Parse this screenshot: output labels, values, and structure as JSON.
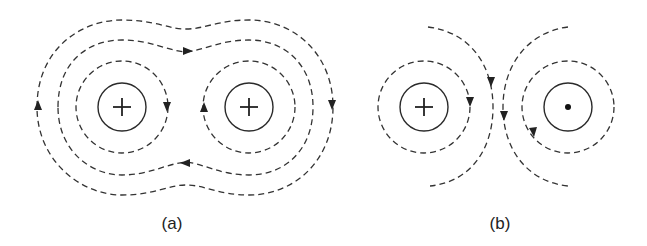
{
  "figure": {
    "panels": [
      {
        "id": "a",
        "caption": "(a)",
        "description": "Magnetic field lines around two parallel currents in the same direction",
        "conductors": [
          {
            "symbol": "+",
            "meaning": "current into page",
            "center": [
              122,
              107
            ]
          },
          {
            "symbol": "+",
            "meaning": "current into page",
            "center": [
              249,
              107
            ]
          }
        ]
      },
      {
        "id": "b",
        "caption": "(b)",
        "description": "Magnetic field lines around two antiparallel currents",
        "conductors": [
          {
            "symbol": "+",
            "meaning": "current into page",
            "center": [
              424,
              107
            ]
          },
          {
            "symbol": "•",
            "meaning": "current out of page",
            "center": [
              568,
              107
            ]
          }
        ]
      }
    ],
    "colors": {
      "line": "#333333",
      "background": "#ffffff"
    }
  }
}
